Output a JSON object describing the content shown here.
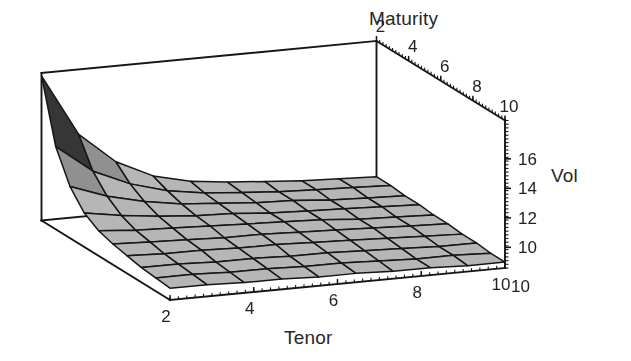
{
  "figure": {
    "kind": "surface-plot-3d",
    "background": "#ffffff",
    "ink_color": "#1c1c1c",
    "surface_fill": "#b3b3b3",
    "surface_fill_dark": "#3a3a3a",
    "mesh_line_color": "#1c1c1c"
  },
  "labels": {
    "maturity": "Maturity",
    "vol": "Vol",
    "tenor": "Tenor"
  },
  "chart_data": {
    "type": "surface",
    "title": "",
    "xlabel": "Tenor",
    "ylabel": "Maturity",
    "zlabel": "Vol",
    "x": [
      1,
      2,
      3,
      4,
      5,
      6,
      7,
      8,
      9,
      10
    ],
    "y": [
      1,
      2,
      3,
      4,
      5,
      6,
      7,
      8,
      9,
      10
    ],
    "xticks": [
      2,
      4,
      6,
      8,
      10
    ],
    "yticks": [
      2,
      4,
      6,
      8,
      10
    ],
    "zticks": [
      10,
      12,
      14,
      16
    ],
    "xlim": [
      1,
      10
    ],
    "ylim": [
      1,
      10
    ],
    "zlim": [
      8.6,
      18.6
    ],
    "grid": false,
    "legend": null,
    "annotations": [],
    "z": [
      [
        18.4,
        14.2,
        12.1,
        10.9,
        10.3,
        10.0,
        9.8,
        9.6,
        9.5,
        9.4
      ],
      [
        14.2,
        12.3,
        11.2,
        10.5,
        10.1,
        9.9,
        9.7,
        9.6,
        9.5,
        9.4
      ],
      [
        12.1,
        11.2,
        10.6,
        10.2,
        10.0,
        9.8,
        9.7,
        9.5,
        9.4,
        9.3
      ],
      [
        10.9,
        10.5,
        10.2,
        10.0,
        9.9,
        9.7,
        9.6,
        9.5,
        9.4,
        9.3
      ],
      [
        10.3,
        10.1,
        10.0,
        9.9,
        9.8,
        9.7,
        9.6,
        9.4,
        9.3,
        9.2
      ],
      [
        10.0,
        9.9,
        9.8,
        9.7,
        9.7,
        9.6,
        9.5,
        9.4,
        9.3,
        9.2
      ],
      [
        9.8,
        9.7,
        9.7,
        9.6,
        9.6,
        9.5,
        9.4,
        9.3,
        9.2,
        9.1
      ],
      [
        9.6,
        9.6,
        9.5,
        9.5,
        9.4,
        9.4,
        9.3,
        9.2,
        9.1,
        9.1
      ],
      [
        9.5,
        9.5,
        9.4,
        9.4,
        9.3,
        9.3,
        9.2,
        9.1,
        9.1,
        9.0
      ],
      [
        9.4,
        9.4,
        9.3,
        9.3,
        9.2,
        9.2,
        9.1,
        9.1,
        9.0,
        9.0
      ]
    ]
  },
  "axes": {
    "maturity_ticks": [
      "2",
      "4",
      "6",
      "8",
      "10"
    ],
    "tenor_ticks": [
      "2",
      "4",
      "6",
      "8",
      "10"
    ],
    "vol_ticks": [
      "16",
      "14",
      "12",
      "10"
    ],
    "tenor_corner_label": "10"
  }
}
